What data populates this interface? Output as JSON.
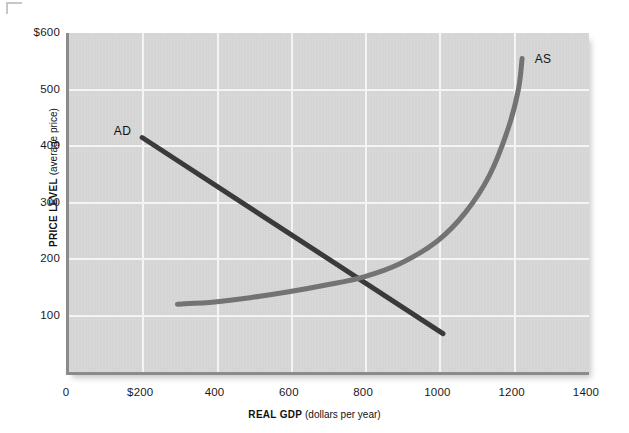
{
  "chart_data": {
    "type": "line",
    "title": "",
    "xlabel_bold": "REAL GDP",
    "xlabel_normal": "(dollars per year)",
    "ylabel_bold": "PRICE LEVEL",
    "ylabel_normal": "(average price)",
    "xlim": [
      0,
      1400
    ],
    "ylim": [
      0,
      600
    ],
    "grid": true,
    "legend_position": "inline-curve-labels",
    "xticks": [
      {
        "value": 0,
        "label": "0"
      },
      {
        "value": 200,
        "label": "$200"
      },
      {
        "value": 400,
        "label": "400"
      },
      {
        "value": 600,
        "label": "600"
      },
      {
        "value": 800,
        "label": "800"
      },
      {
        "value": 1000,
        "label": "1000"
      },
      {
        "value": 1200,
        "label": "1200"
      },
      {
        "value": 1400,
        "label": "1400"
      }
    ],
    "yticks": [
      {
        "value": 600,
        "label": "$600"
      },
      {
        "value": 500,
        "label": "500"
      },
      {
        "value": 400,
        "label": "400"
      },
      {
        "value": 300,
        "label": "300"
      },
      {
        "value": 200,
        "label": "200"
      },
      {
        "value": 100,
        "label": "100"
      }
    ],
    "gridlines_x": [
      200,
      400,
      600,
      800,
      1000,
      1200
    ],
    "gridlines_y": [
      100,
      200,
      300,
      400,
      500
    ],
    "series": [
      {
        "name": "AD",
        "label": "AD",
        "color": "#3a3a3a",
        "width": 5,
        "shape": "straight-line",
        "points": [
          {
            "x": 205,
            "y": 415
          },
          {
            "x": 1015,
            "y": 68
          }
        ]
      },
      {
        "name": "AS",
        "label": "AS",
        "color": "#737373",
        "width": 5,
        "shape": "upward-curve",
        "points": [
          {
            "x": 300,
            "y": 120
          },
          {
            "x": 400,
            "y": 124
          },
          {
            "x": 500,
            "y": 132
          },
          {
            "x": 600,
            "y": 142
          },
          {
            "x": 700,
            "y": 154
          },
          {
            "x": 800,
            "y": 168
          },
          {
            "x": 900,
            "y": 192
          },
          {
            "x": 1000,
            "y": 232
          },
          {
            "x": 1075,
            "y": 282
          },
          {
            "x": 1140,
            "y": 348
          },
          {
            "x": 1190,
            "y": 430
          },
          {
            "x": 1218,
            "y": 500
          },
          {
            "x": 1228,
            "y": 555
          }
        ]
      }
    ],
    "annotations": [
      {
        "text": "AD",
        "x": 188,
        "y": 425,
        "anchor": "end"
      },
      {
        "text": "AS",
        "x": 1262,
        "y": 552,
        "anchor": "start"
      }
    ],
    "equilibrium": {
      "x": 815,
      "y": 166
    },
    "colors": {
      "plot_background": "#d9d9d9",
      "page_background": "#ffffff",
      "gridline": "#f4f4f4",
      "axis": "#8b8b8b",
      "ad_curve": "#3a3a3a",
      "as_curve": "#737373",
      "text": "#1a1a1a"
    }
  }
}
